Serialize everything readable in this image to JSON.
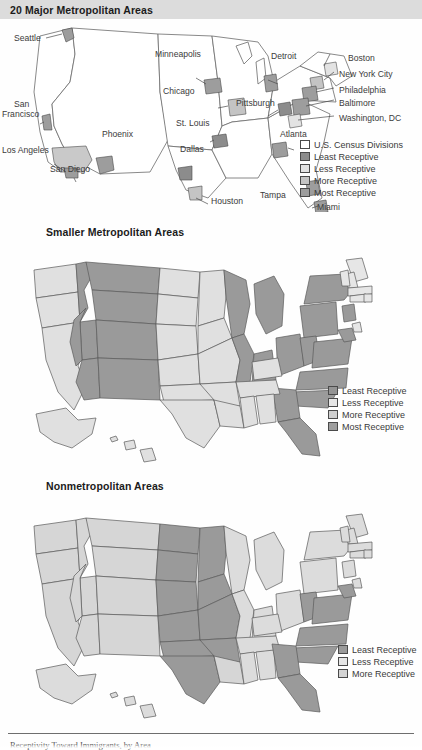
{
  "figure": {
    "caption": "Receptivity Toward Immigrants, by Area"
  },
  "panels": [
    {
      "id": "major-metro",
      "title": "20 Major Metropolitan Areas",
      "legend": [
        {
          "label": "U.S. Census Divisions",
          "color": "#ffffff"
        },
        {
          "label": "Least Receptive",
          "color": "#8c8c8c"
        },
        {
          "label": "Less Receptive",
          "color": "#e3e3e3"
        },
        {
          "label": "More Receptive",
          "color": "#c4c4c4"
        },
        {
          "label": "Most Receptive",
          "color": "#9d9d9d"
        }
      ],
      "cities": [
        {
          "name": "Seattle",
          "class": "r",
          "x": 14,
          "y": 34
        },
        {
          "name": "San",
          "class": "r",
          "x": 14,
          "y": 100
        },
        {
          "name": "Francisco",
          "class": "r",
          "x": 2,
          "y": 110
        },
        {
          "name": "Los Angeles",
          "class": "r",
          "x": 2,
          "y": 146
        },
        {
          "name": "San Diego",
          "class": "",
          "x": 50,
          "y": 165
        },
        {
          "name": "Phoenix",
          "class": "",
          "x": 102,
          "y": 130
        },
        {
          "name": "Dallas",
          "class": "",
          "x": 180,
          "y": 145
        },
        {
          "name": "Houston",
          "class": "",
          "x": 211,
          "y": 197
        },
        {
          "name": "Minneapolis",
          "class": "",
          "x": 155,
          "y": 50
        },
        {
          "name": "Chicago",
          "class": "",
          "x": 163,
          "y": 87
        },
        {
          "name": "St. Louis",
          "class": "",
          "x": 176,
          "y": 119
        },
        {
          "name": "Pittsburgh",
          "class": "",
          "x": 236,
          "y": 99
        },
        {
          "name": "Detroit",
          "class": "",
          "x": 271,
          "y": 52
        },
        {
          "name": "Atlanta",
          "class": "",
          "x": 280,
          "y": 130
        },
        {
          "name": "Tampa",
          "class": "",
          "x": 260,
          "y": 191
        },
        {
          "name": "Miami",
          "class": "",
          "x": 317,
          "y": 203
        },
        {
          "name": "Boston",
          "class": "",
          "x": 348,
          "y": 54
        },
        {
          "name": "New York City",
          "class": "",
          "x": 339,
          "y": 70
        },
        {
          "name": "Philadelphia",
          "class": "",
          "x": 339,
          "y": 86
        },
        {
          "name": "Baltimore",
          "class": "",
          "x": 339,
          "y": 99
        },
        {
          "name": "Washington, DC",
          "class": "",
          "x": 339,
          "y": 114
        }
      ]
    },
    {
      "id": "smaller-metro",
      "title": "Smaller Metropolitan Areas",
      "legend": [
        {
          "label": "Least Receptive",
          "color": "#949494"
        },
        {
          "label": "Less Receptive",
          "color": "#e6e6e6"
        },
        {
          "label": "More Receptive",
          "color": "#cfcfcf"
        },
        {
          "label": "Most Receptive",
          "color": "#9e9e9e"
        }
      ]
    },
    {
      "id": "nonmetro",
      "title": "Nonmetropolitan Areas",
      "legend": [
        {
          "label": "Least Receptive",
          "color": "#9a9a9a"
        },
        {
          "label": "Less Receptive",
          "color": "#e6e6e6"
        },
        {
          "label": "More Receptive",
          "color": "#d4d4d4"
        }
      ]
    }
  ],
  "chart_data": {
    "type": "map",
    "title": "Receptivity Toward Immigrants, by Area",
    "legend_position": "inside-right",
    "palette": {
      "census_divisions": "#ffffff",
      "least_receptive": "#949494",
      "less_receptive": "#e6e6e6",
      "more_receptive": "#cfcfcf",
      "most_receptive": "#9e9e9e",
      "outline": "#5a5a5a"
    },
    "panels": [
      {
        "name": "20 Major Metropolitan Areas",
        "categories": [
          "Least Receptive",
          "Less Receptive",
          "More Receptive",
          "Most Receptive"
        ],
        "metros": [
          {
            "city": "Seattle",
            "receptivity": "Most Receptive"
          },
          {
            "city": "San Francisco",
            "receptivity": "Most Receptive"
          },
          {
            "city": "Los Angeles",
            "receptivity": "More Receptive"
          },
          {
            "city": "San Diego",
            "receptivity": "Most Receptive"
          },
          {
            "city": "Phoenix",
            "receptivity": "Most Receptive"
          },
          {
            "city": "Dallas",
            "receptivity": "Least Receptive"
          },
          {
            "city": "Houston",
            "receptivity": "More Receptive"
          },
          {
            "city": "Minneapolis",
            "receptivity": "Most Receptive"
          },
          {
            "city": "Chicago",
            "receptivity": "More Receptive"
          },
          {
            "city": "St. Louis",
            "receptivity": "Least Receptive"
          },
          {
            "city": "Pittsburgh",
            "receptivity": "Least Receptive"
          },
          {
            "city": "Detroit",
            "receptivity": "Most Receptive"
          },
          {
            "city": "Atlanta",
            "receptivity": "Most Receptive"
          },
          {
            "city": "Tampa",
            "receptivity": "Most Receptive"
          },
          {
            "city": "Miami",
            "receptivity": "Most Receptive"
          },
          {
            "city": "Boston",
            "receptivity": "Less Receptive"
          },
          {
            "city": "New York City",
            "receptivity": "More Receptive"
          },
          {
            "city": "Philadelphia",
            "receptivity": "Most Receptive"
          },
          {
            "city": "Baltimore",
            "receptivity": "Most Receptive"
          },
          {
            "city": "Washington, DC",
            "receptivity": "Less Receptive"
          }
        ]
      },
      {
        "name": "Smaller Metropolitan Areas",
        "categories": [
          "Least Receptive",
          "Less Receptive",
          "More Receptive",
          "Most Receptive"
        ],
        "states": {
          "WA": "More Receptive",
          "OR": "More Receptive",
          "CA": "More Receptive",
          "ID": "Least Receptive",
          "NV": "Least Receptive",
          "MT": "Least Receptive",
          "WY": "Least Receptive",
          "UT": "Least Receptive",
          "CO": "Least Receptive",
          "AZ": "Least Receptive",
          "NM": "Least Receptive",
          "ND": "Less Receptive",
          "SD": "Less Receptive",
          "NE": "Less Receptive",
          "KS": "Less Receptive",
          "OK": "Less Receptive",
          "TX": "Less Receptive",
          "MN": "Less Receptive",
          "IA": "Less Receptive",
          "MO": "Less Receptive",
          "AR": "Less Receptive",
          "LA": "Less Receptive",
          "MS": "More Receptive",
          "AL": "More Receptive",
          "TN": "More Receptive",
          "KY": "More Receptive",
          "WI": "Most Receptive",
          "MI": "Most Receptive",
          "IL": "Most Receptive",
          "IN": "Most Receptive",
          "OH": "Most Receptive",
          "PA": "Most Receptive",
          "NY": "Most Receptive",
          "WV": "Most Receptive",
          "VA": "Most Receptive",
          "NC": "Most Receptive",
          "SC": "Most Receptive",
          "GA": "Most Receptive",
          "FL": "Most Receptive",
          "MD": "Most Receptive",
          "NJ": "Most Receptive",
          "ME": "Less Receptive",
          "NH": "Less Receptive",
          "VT": "Less Receptive",
          "MA": "Less Receptive",
          "CT": "Less Receptive",
          "RI": "Less Receptive",
          "DE": "Less Receptive",
          "AK": "More Receptive",
          "HI": "More Receptive"
        }
      },
      {
        "name": "Nonmetropolitan Areas",
        "categories": [
          "Least Receptive",
          "Less Receptive",
          "More Receptive"
        ],
        "states": {
          "WA": "More Receptive",
          "OR": "More Receptive",
          "CA": "More Receptive",
          "ID": "More Receptive",
          "NV": "More Receptive",
          "MT": "More Receptive",
          "WY": "More Receptive",
          "UT": "More Receptive",
          "CO": "More Receptive",
          "AZ": "More Receptive",
          "NM": "More Receptive",
          "ND": "Least Receptive",
          "SD": "Least Receptive",
          "NE": "Least Receptive",
          "KS": "Least Receptive",
          "OK": "Least Receptive",
          "TX": "Least Receptive",
          "MN": "Least Receptive",
          "IA": "Least Receptive",
          "MO": "Least Receptive",
          "AR": "Least Receptive",
          "LA": "Less Receptive",
          "WI": "Less Receptive",
          "MI": "Less Receptive",
          "IL": "Less Receptive",
          "IN": "Less Receptive",
          "OH": "Less Receptive",
          "PA": "Less Receptive",
          "NY": "Less Receptive",
          "KY": "Less Receptive",
          "TN": "Less Receptive",
          "MS": "Less Receptive",
          "AL": "Less Receptive",
          "WV": "Least Receptive",
          "VA": "Least Receptive",
          "MD": "Least Receptive",
          "NC": "Least Receptive",
          "SC": "Least Receptive",
          "GA": "Least Receptive",
          "FL": "Least Receptive",
          "ME": "Less Receptive",
          "NH": "Less Receptive",
          "VT": "Less Receptive",
          "MA": "Less Receptive",
          "CT": "Less Receptive",
          "RI": "Less Receptive",
          "NJ": "Less Receptive",
          "DE": "Less Receptive",
          "AK": "Less Receptive",
          "HI": "Less Receptive"
        }
      }
    ]
  }
}
